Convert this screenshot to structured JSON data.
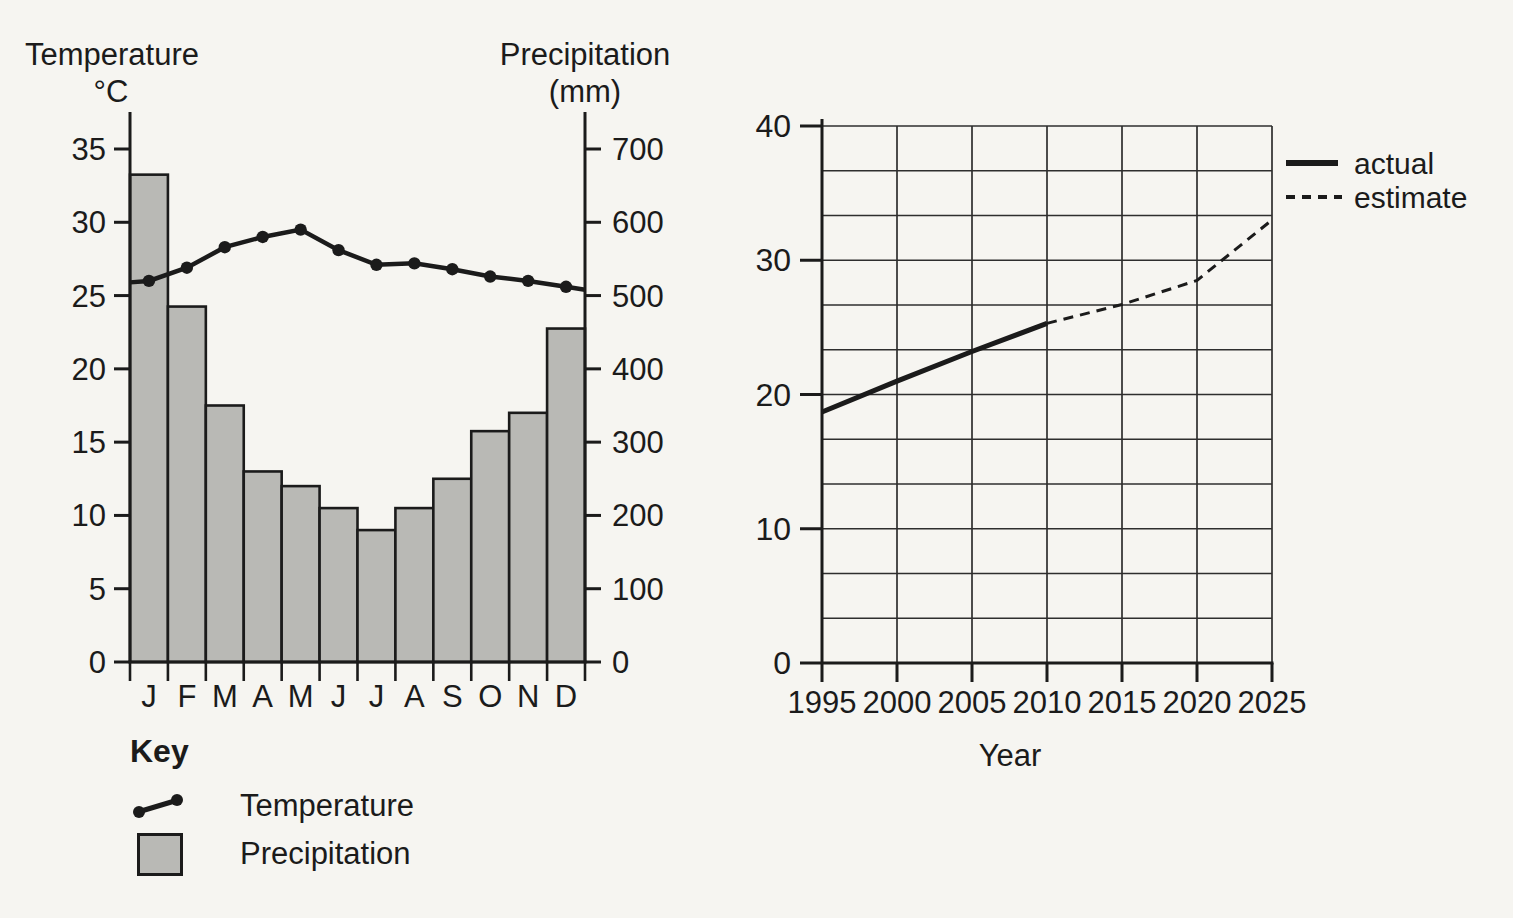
{
  "page": {
    "background": "#f6f5f1",
    "ink": "#1b1b1b",
    "grid_color": "#2e2e2e"
  },
  "chart_data": [
    {
      "id": "climate-graph",
      "type": "bar",
      "title_left": "Temperature",
      "title_left_unit": "°C",
      "title_right": "Precipitation",
      "title_right_unit": "(mm)",
      "categories": [
        "J",
        "F",
        "M",
        "A",
        "M",
        "J",
        "J",
        "A",
        "S",
        "O",
        "N",
        "D"
      ],
      "series": [
        {
          "name": "Temperature",
          "type": "line",
          "axis": "left",
          "unit": "°C",
          "values": [
            26,
            26.9,
            28.3,
            29,
            29.5,
            28.1,
            27.1,
            27.2,
            26.8,
            26.3,
            26,
            25.6
          ],
          "edge_start": 25.9,
          "edge_end": 25.4
        },
        {
          "name": "Precipitation",
          "type": "bar",
          "axis": "right",
          "unit": "mm",
          "values": [
            665,
            485,
            350,
            260,
            240,
            210,
            180,
            210,
            250,
            315,
            340,
            455
          ]
        }
      ],
      "left_axis": {
        "label": "Temperature °C",
        "ticks": [
          35,
          30,
          25,
          20,
          15,
          10,
          5,
          0
        ],
        "max": 35
      },
      "right_axis": {
        "label": "Precipitation (mm)",
        "ticks": [
          700,
          600,
          500,
          400,
          300,
          200,
          100,
          0
        ],
        "max": 700
      },
      "bar_fill": "#b9b9b5",
      "key": {
        "title": "Key",
        "items": [
          {
            "label": "Temperature",
            "swatch": "line-with-dots"
          },
          {
            "label": "Precipitation",
            "swatch": "filled-box"
          }
        ]
      }
    },
    {
      "id": "projection-graph",
      "type": "line",
      "xlabel": "Year",
      "xlim": [
        1995,
        2025
      ],
      "ylim": [
        0,
        40
      ],
      "x_ticks": [
        1995,
        2000,
        2005,
        2010,
        2015,
        2020,
        2025
      ],
      "y_ticks": [
        40,
        30,
        20,
        10,
        0
      ],
      "grid": {
        "x_step_years": 5,
        "y_divisions_per_tick": 3
      },
      "series": [
        {
          "name": "actual",
          "style": "solid",
          "points": [
            [
              1995,
              18.7
            ],
            [
              2000,
              21
            ],
            [
              2005,
              23.2
            ],
            [
              2010,
              25.3
            ]
          ]
        },
        {
          "name": "estimate",
          "style": "dashed",
          "points": [
            [
              2010,
              25.3
            ],
            [
              2015,
              26.7
            ],
            [
              2020,
              28.5
            ],
            [
              2025,
              33
            ]
          ]
        }
      ],
      "legend": [
        {
          "label": "actual",
          "style": "solid"
        },
        {
          "label": "estimate",
          "style": "dashed"
        }
      ]
    }
  ]
}
